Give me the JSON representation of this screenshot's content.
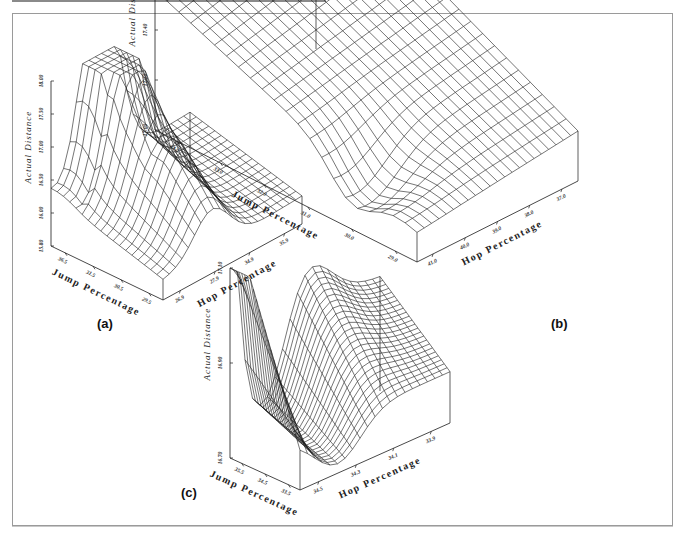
{
  "figure": {
    "border_color": "#9a9a9a",
    "line_color": "#1a1a1a",
    "panels": [
      {
        "id": "a",
        "label": "(a)"
      },
      {
        "id": "b",
        "label": "(b)"
      },
      {
        "id": "c",
        "label": "(c)"
      }
    ]
  },
  "chart_data": [
    {
      "type": "surface",
      "panel": "(a)",
      "title": "",
      "zlabel": "Actual Distance",
      "xlabel": "Jump Percentage",
      "ylabel": "Hop Percentage",
      "z_ticks": [
        "15.80",
        "16.00",
        "16.50",
        "17.00",
        "17.50",
        "18.00"
      ],
      "x_ticks": [
        "36.5",
        "31.5",
        "30.5",
        "29.5"
      ],
      "y_ticks": [
        "26.9",
        "27.9",
        "34.9",
        "35.9"
      ],
      "zlim": [
        15.8,
        18.0
      ],
      "grid_size": [
        18,
        22
      ],
      "shape": "rugged ridge rising toward back with sharp peak; jagged spikes along front-left edge"
    },
    {
      "type": "surface",
      "panel": "(b)",
      "title": "",
      "zlabel": "Actual Distance",
      "xlabel": "Jump Percentage",
      "ylabel": "Hop Percentage",
      "z_ticks": [
        "17.00",
        "17.20",
        "17.40",
        "17.60",
        "17.80"
      ],
      "x_ticks": [
        "34.0",
        "33.0",
        "32.0",
        "31.0",
        "30.0",
        "29.0"
      ],
      "y_ticks": [
        "41.0",
        "40.0",
        "39.0",
        "38.0",
        "37.0"
      ],
      "zlim": [
        17.0,
        17.8
      ],
      "grid_size": [
        22,
        22
      ],
      "shape": "smooth saddle-like surface with pinched minimum near front-left, rising to a high back corner"
    },
    {
      "type": "surface",
      "panel": "(c)",
      "title": "",
      "zlabel": "Actual Distance",
      "xlabel": "Jump Percentage",
      "ylabel": "Hop Percentage",
      "z_ticks": [
        "16.70",
        "16.90",
        "17.10"
      ],
      "x_ticks": [
        "35.5",
        "34.5",
        "33.5"
      ],
      "y_ticks": [
        "34.5",
        "34.3",
        "34.1",
        "33.9"
      ],
      "zlim": [
        16.7,
        17.2
      ],
      "grid_size": [
        24,
        20
      ],
      "shape": "deep trough valley along hop axis with high walls at left and back ridge"
    }
  ]
}
